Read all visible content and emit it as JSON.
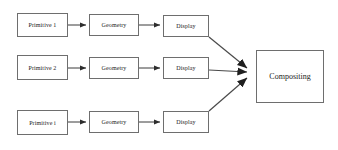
{
  "diagram": {
    "type": "flow-diagram",
    "background_color": "#ffffff",
    "box_border_color": "#6e6e6e",
    "arrow_color": "#3a3a3a",
    "text_color": "#1a1a1a",
    "rows": [
      {
        "id": "row-1",
        "nodes": [
          {
            "id": "primitive-1",
            "label": "Primitive 1",
            "x": 17,
            "y": 13,
            "w": 51,
            "h": 24
          },
          {
            "id": "geometry-1",
            "label": "Geometry",
            "x": 89,
            "y": 14,
            "w": 50,
            "h": 22
          },
          {
            "id": "display-1",
            "label": "Display",
            "x": 163,
            "y": 15,
            "w": 46,
            "h": 22
          }
        ]
      },
      {
        "id": "row-2",
        "nodes": [
          {
            "id": "primitive-2",
            "label": "Primitive 2",
            "x": 17,
            "y": 55,
            "w": 51,
            "h": 25
          },
          {
            "id": "geometry-2",
            "label": "Geometry",
            "x": 89,
            "y": 57,
            "w": 50,
            "h": 22
          },
          {
            "id": "display-2",
            "label": "Display",
            "x": 163,
            "y": 57,
            "w": 46,
            "h": 22
          }
        ]
      },
      {
        "id": "row-3",
        "nodes": [
          {
            "id": "primitive-3",
            "label": "Primitive i",
            "x": 17,
            "y": 110,
            "w": 51,
            "h": 25
          },
          {
            "id": "geometry-3",
            "label": "Geometry",
            "x": 89,
            "y": 111,
            "w": 50,
            "h": 22
          },
          {
            "id": "display-3",
            "label": "Display",
            "x": 163,
            "y": 111,
            "w": 46,
            "h": 22
          }
        ]
      }
    ],
    "sink": {
      "id": "compositing",
      "label": "Compositing",
      "x": 256,
      "y": 50,
      "w": 68,
      "h": 53
    },
    "connections": [
      {
        "id": "conn-p1-g1",
        "kind": "horizontal",
        "from": "primitive-1",
        "to": "geometry-1",
        "x1": 68,
        "y1": 25,
        "x2": 89,
        "y2": 25
      },
      {
        "id": "conn-g1-d1",
        "kind": "horizontal",
        "from": "geometry-1",
        "to": "display-1",
        "x1": 139,
        "y1": 25,
        "x2": 163,
        "y2": 25
      },
      {
        "id": "conn-p2-g2",
        "kind": "horizontal",
        "from": "primitive-2",
        "to": "geometry-2",
        "x1": 68,
        "y1": 68,
        "x2": 89,
        "y2": 68
      },
      {
        "id": "conn-g2-d2",
        "kind": "horizontal",
        "from": "geometry-2",
        "to": "display-2",
        "x1": 139,
        "y1": 68,
        "x2": 163,
        "y2": 68
      },
      {
        "id": "conn-p3-g3",
        "kind": "horizontal",
        "from": "primitive-3",
        "to": "geometry-3",
        "x1": 68,
        "y1": 122,
        "x2": 89,
        "y2": 122
      },
      {
        "id": "conn-g3-d3",
        "kind": "horizontal",
        "from": "geometry-3",
        "to": "display-3",
        "x1": 139,
        "y1": 122,
        "x2": 163,
        "y2": 122
      },
      {
        "id": "conn-d1-comp",
        "kind": "diagonal",
        "from": "display-1",
        "to": "compositing",
        "x1": 209,
        "y1": 37,
        "x2": 254,
        "y2": 73
      },
      {
        "id": "conn-d2-comp",
        "kind": "horizontal",
        "from": "display-2",
        "to": "compositing",
        "x1": 209,
        "y1": 70,
        "x2": 254,
        "y2": 73
      },
      {
        "id": "conn-d3-comp",
        "kind": "diagonal",
        "from": "display-3",
        "to": "compositing",
        "x1": 209,
        "y1": 111,
        "x2": 254,
        "y2": 73
      }
    ]
  }
}
